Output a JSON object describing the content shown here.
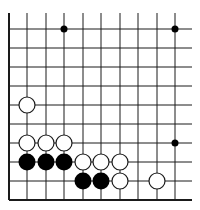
{
  "diagram": {
    "type": "go-board-fragment",
    "corner": "bottom-left",
    "colors": {
      "line": "#1a1a1a",
      "black_stone": "#000000",
      "white_stone": "#ffffff",
      "background": "#ffffff"
    },
    "grid": {
      "x_lines": [
        9,
        27,
        46,
        64,
        83,
        101,
        120,
        138,
        157,
        175
      ],
      "y_lines": [
        29,
        48,
        67,
        86,
        105,
        124,
        143,
        162,
        181,
        200
      ],
      "left_edge": 9,
      "bottom_edge": 200,
      "open_top": 13,
      "open_right": 192
    },
    "small_points": [
      {
        "col": 3,
        "row": 0
      },
      {
        "col": 9,
        "row": 0
      },
      {
        "col": 9,
        "row": 6
      }
    ],
    "white_stones": [
      {
        "col": 1,
        "row": 4
      },
      {
        "col": 1,
        "row": 6
      },
      {
        "col": 2,
        "row": 6
      },
      {
        "col": 3,
        "row": 6
      },
      {
        "col": 4,
        "row": 7
      },
      {
        "col": 5,
        "row": 7
      },
      {
        "col": 6,
        "row": 7
      },
      {
        "col": 6,
        "row": 8
      },
      {
        "col": 8,
        "row": 8
      }
    ],
    "black_stones": [
      {
        "col": 1,
        "row": 7
      },
      {
        "col": 2,
        "row": 7
      },
      {
        "col": 3,
        "row": 7
      },
      {
        "col": 4,
        "row": 8
      },
      {
        "col": 5,
        "row": 8
      }
    ]
  }
}
